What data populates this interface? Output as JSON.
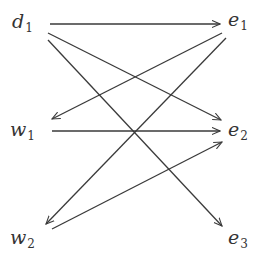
{
  "diagram": {
    "type": "directed-graph",
    "colors": {
      "edge": "#3a3a3a",
      "label": "#333333",
      "background": "#ffffff"
    },
    "nodes": [
      {
        "id": "d1",
        "base": "d",
        "sub": "1",
        "x": 12,
        "y": 12
      },
      {
        "id": "w1",
        "base": "w",
        "sub": "1",
        "x": 10,
        "y": 120
      },
      {
        "id": "w2",
        "base": "w",
        "sub": "2",
        "x": 10,
        "y": 228
      },
      {
        "id": "e1",
        "base": "e",
        "sub": "1",
        "x": 228,
        "y": 10
      },
      {
        "id": "e2",
        "base": "e",
        "sub": "2",
        "x": 228,
        "y": 120
      },
      {
        "id": "e3",
        "base": "e",
        "sub": "3",
        "x": 228,
        "y": 228
      }
    ],
    "edges": [
      {
        "from": "d1",
        "to": "e1",
        "x1": 50,
        "y1": 24,
        "x2": 220,
        "y2": 24
      },
      {
        "from": "d1",
        "to": "e2",
        "x1": 48,
        "y1": 33,
        "x2": 221,
        "y2": 120
      },
      {
        "from": "d1",
        "to": "e3",
        "x1": 48,
        "y1": 40,
        "x2": 222,
        "y2": 226
      },
      {
        "from": "e1",
        "to": "w1",
        "x1": 222,
        "y1": 33,
        "x2": 52,
        "y2": 119
      },
      {
        "from": "e1",
        "to": "w2",
        "x1": 226,
        "y1": 38,
        "x2": 46,
        "y2": 224
      },
      {
        "from": "w1",
        "to": "e2",
        "x1": 52,
        "y1": 131,
        "x2": 220,
        "y2": 131
      },
      {
        "from": "w2",
        "to": "e2",
        "x1": 52,
        "y1": 229,
        "x2": 222,
        "y2": 142
      }
    ]
  }
}
